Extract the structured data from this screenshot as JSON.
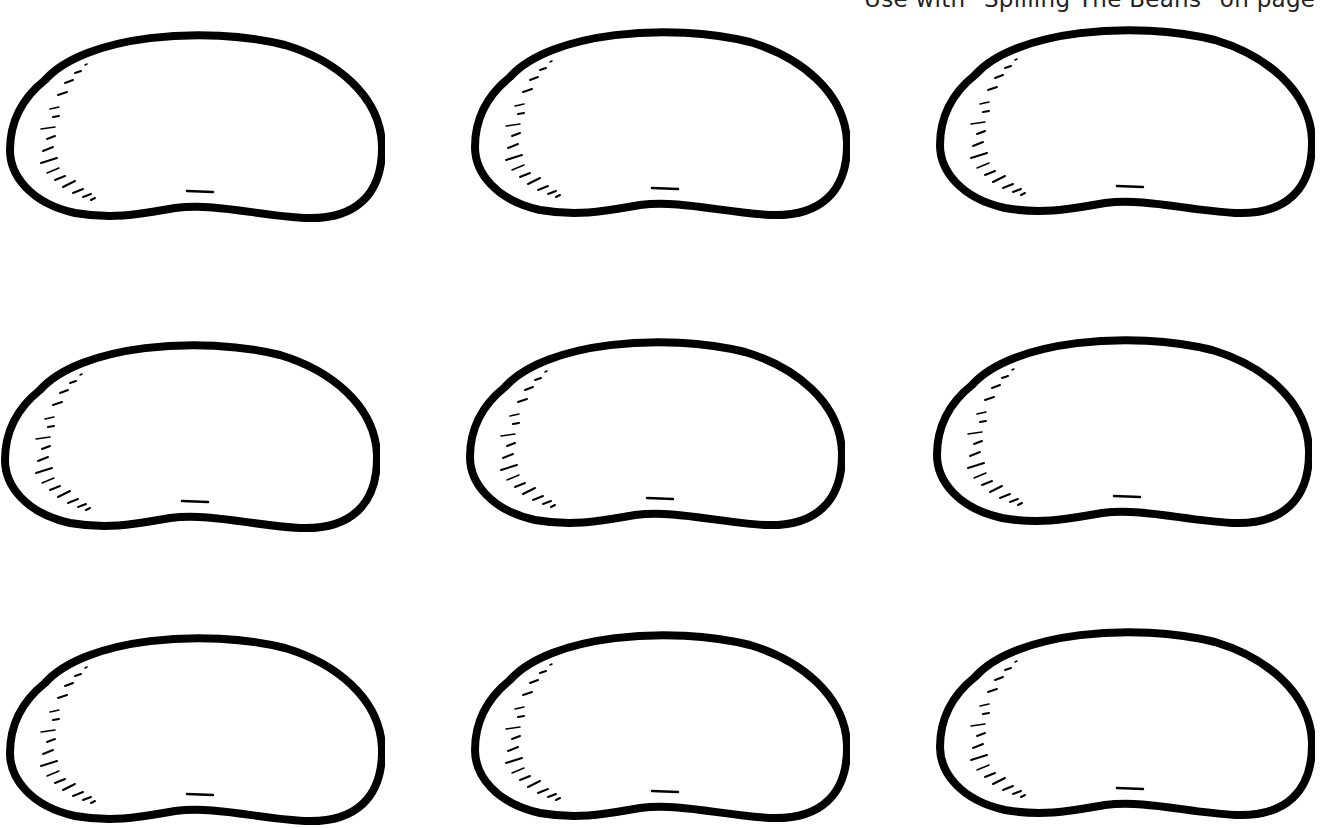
{
  "page": {
    "caption": "Use with \"Spilling The Beans\" on page",
    "stroke_color": "#000000",
    "background": "#ffffff"
  },
  "beans": [
    {
      "row": 1,
      "col": 1,
      "x": 5,
      "y": 25
    },
    {
      "row": 1,
      "col": 2,
      "x": 470,
      "y": 22
    },
    {
      "row": 1,
      "col": 3,
      "x": 935,
      "y": 20
    },
    {
      "row": 2,
      "col": 1,
      "x": 0,
      "y": 335
    },
    {
      "row": 2,
      "col": 2,
      "x": 465,
      "y": 332
    },
    {
      "row": 2,
      "col": 3,
      "x": 932,
      "y": 330
    },
    {
      "row": 3,
      "col": 1,
      "x": 5,
      "y": 628
    },
    {
      "row": 3,
      "col": 2,
      "x": 470,
      "y": 625
    },
    {
      "row": 3,
      "col": 3,
      "x": 935,
      "y": 622
    }
  ]
}
